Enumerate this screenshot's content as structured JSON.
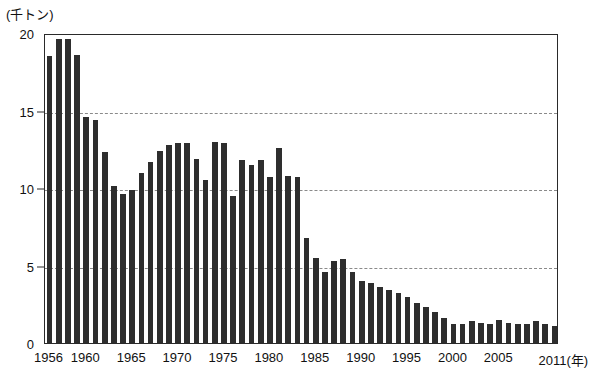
{
  "chart_data": {
    "type": "bar",
    "title": "",
    "subtitle": "",
    "xlabel": "年",
    "ylabel": "千トン",
    "unit_label": "(千トン)",
    "x_axis_suffix": "(年)",
    "ylim": [
      0,
      20
    ],
    "y_ticks": [
      0,
      5,
      10,
      15,
      20
    ],
    "x_tick_labels": [
      "1956",
      "1960",
      "1965",
      "1970",
      "1975",
      "1980",
      "1985",
      "1990",
      "1995",
      "2000",
      "2005",
      "2011"
    ],
    "x_tick_years": [
      1956,
      1960,
      1965,
      1970,
      1975,
      1980,
      1985,
      1990,
      1995,
      2000,
      2005,
      2011
    ],
    "grid": "horizontal-dashed",
    "legend": "none",
    "bar_color": "#2e2e2e",
    "categories": [
      1956,
      1957,
      1958,
      1959,
      1960,
      1961,
      1962,
      1963,
      1964,
      1965,
      1966,
      1967,
      1968,
      1969,
      1970,
      1971,
      1972,
      1973,
      1974,
      1975,
      1976,
      1977,
      1978,
      1979,
      1980,
      1981,
      1982,
      1983,
      1984,
      1985,
      1986,
      1987,
      1988,
      1989,
      1990,
      1991,
      1992,
      1993,
      1994,
      1995,
      1996,
      1997,
      1998,
      1999,
      2000,
      2001,
      2002,
      2003,
      2004,
      2005,
      2006,
      2007,
      2008,
      2009,
      2010,
      2011
    ],
    "values": [
      18.5,
      19.6,
      19.6,
      18.6,
      14.6,
      14.4,
      12.3,
      10.1,
      9.6,
      9.9,
      11.0,
      11.7,
      12.4,
      12.8,
      12.9,
      12.9,
      11.9,
      10.5,
      13.0,
      12.9,
      9.5,
      11.8,
      11.5,
      11.8,
      10.7,
      12.6,
      10.8,
      10.7,
      6.8,
      5.5,
      4.6,
      5.3,
      5.4,
      4.6,
      4.0,
      3.9,
      3.6,
      3.4,
      3.2,
      3.0,
      2.6,
      2.3,
      2.0,
      1.6,
      1.2,
      1.2,
      1.4,
      1.3,
      1.2,
      1.5,
      1.3,
      1.2,
      1.2,
      1.4,
      1.2,
      1.1
    ]
  }
}
